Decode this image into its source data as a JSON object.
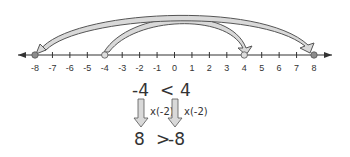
{
  "number_line": {
    "min": -8,
    "max": 8,
    "tick_labels": [
      "-8",
      "-7",
      "-6",
      "-5",
      "-4",
      "-3",
      "-2",
      "-1",
      "0",
      "1",
      "2",
      "3",
      "4",
      "5",
      "6",
      "7",
      "8"
    ],
    "marked_points": [
      -8,
      -4,
      4,
      8
    ]
  },
  "arcs": [
    {
      "from": -4,
      "to": 4,
      "label": "arc from -4 to 4"
    },
    {
      "from": 4,
      "to": -8,
      "label": "arc from 4 to -8"
    }
  ],
  "inequality": {
    "top_left": "-4",
    "top_op": "<",
    "top_right": "4",
    "multiplier_left": "x(-2)",
    "multiplier_right": "x(-2)",
    "bottom_left": "8",
    "bottom_op": ">",
    "bottom_right": "-8"
  },
  "colors": {
    "line": "#333333",
    "arrow_fill": "#d9d9d9",
    "arrow_stroke": "#555555",
    "point_fill": "#8c8c8c"
  }
}
